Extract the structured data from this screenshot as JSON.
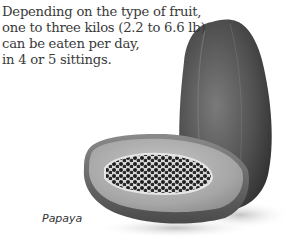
{
  "description": {
    "lines": [
      "Depending on the type of fruit,",
      "one to three kilos (2.2 to 6.6 lb)",
      "can be eaten per day,",
      "in 4 or 5 sittings."
    ]
  },
  "caption": "Papaya",
  "illustration": {
    "subject": "papaya-whole-and-halved",
    "palette": {
      "skin_dark": "#3c3c3c",
      "skin_mid": "#6a6a6a",
      "flesh": "#9a9a9a",
      "flesh_light": "#c4c4c4",
      "seeds": "#1e1e1e",
      "background": "#ffffff"
    }
  }
}
